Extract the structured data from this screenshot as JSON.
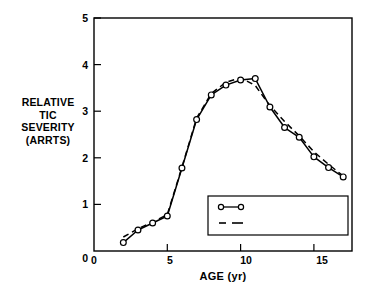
{
  "chart_data": {
    "type": "line",
    "title": "",
    "xlabel": "AGE  (yr)",
    "ylabel": "RELATIVE\nTIC\nSEVERITY\n(ARRTS)",
    "ylabel_lines": [
      "RELATIVE",
      "TIC",
      "SEVERITY",
      "(ARRTS)"
    ],
    "xlim": [
      0,
      17.6
    ],
    "ylim": [
      0,
      5
    ],
    "xticks": [
      0,
      5,
      10,
      15
    ],
    "xtick_labels": [
      "0",
      "5",
      "10",
      "15"
    ],
    "yticks": [
      0,
      1,
      2,
      3,
      4,
      5
    ],
    "ytick_labels": [
      "0",
      "1",
      "2",
      "3",
      "4",
      "5"
    ],
    "ytick_labels_shown": [
      "1",
      "2",
      "3",
      "4",
      "5"
    ],
    "grid": false,
    "legend_position": "lower right",
    "x": [
      2,
      3,
      4,
      5,
      6,
      7,
      8,
      9,
      10,
      11,
      12,
      13,
      14,
      15,
      16,
      17
    ],
    "series": [
      {
        "name": "Actual Means",
        "style": "solid-with-open-circles",
        "values": [
          0.18,
          0.45,
          0.6,
          0.75,
          1.78,
          2.82,
          3.35,
          3.56,
          3.67,
          3.7,
          3.09,
          2.65,
          2.44,
          2.02,
          1.79,
          1.59
        ]
      },
      {
        "name": "Estimates from Model",
        "style": "dashed",
        "values": [
          0.3,
          0.48,
          0.62,
          0.78,
          1.8,
          2.85,
          3.38,
          3.62,
          3.72,
          3.55,
          3.12,
          2.78,
          2.47,
          2.13,
          1.86,
          1.61
        ]
      }
    ]
  },
  "legend": {
    "items": [
      {
        "label": "Actual Means",
        "marker": "circle-line-circle"
      },
      {
        "label": "Estimates from Model",
        "marker": "dashed-line"
      }
    ]
  },
  "colors": {
    "axis": "#000000",
    "actual_line": "#000000",
    "model_line": "#000000",
    "marker_fill": "#ffffff",
    "background": "#ffffff"
  }
}
